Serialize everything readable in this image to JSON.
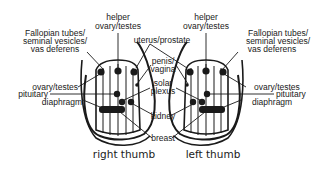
{
  "diagram": {
    "thumbs": [
      {
        "id": "right",
        "caption": "right thumb"
      },
      {
        "id": "left",
        "caption": "left thumb"
      }
    ],
    "labels": {
      "helper_line1": "helper",
      "helper_line2": "ovary/testes",
      "fallopian_line1": "Fallopian tubes/",
      "fallopian_line2": "seminal vesicles/",
      "fallopian_line3": "vas deferens",
      "uterus": "uterus/prostate",
      "penis_line1": "penis/",
      "penis_line2": "vagina",
      "solar_line1": "solar",
      "solar_line2": "plexus",
      "ovary": "ovary/testes",
      "pituitary": "pituitary",
      "diaphragm": "diaphragm",
      "kidney": "kidney",
      "breast": "breast"
    },
    "colors": {
      "ink": "#1a1a1a",
      "background": "#ffffff"
    }
  }
}
